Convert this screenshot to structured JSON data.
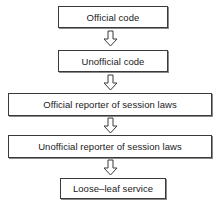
{
  "diagram": {
    "orientation": "vertical",
    "style": {
      "background": "#ffffff",
      "box_border": "#3a3a3a",
      "box_shadow": "#8a8a8a",
      "text_color": "#1a1a1a",
      "arrow_outline": "#3a3a3a",
      "arrow_fill": "#ffffff"
    },
    "nodes": [
      {
        "id": "official-code",
        "label": "Official code",
        "width": "narrow"
      },
      {
        "id": "unofficial-code",
        "label": "Unofficial code",
        "width": "narrow"
      },
      {
        "id": "official-reporter",
        "label": "Official reporter of session laws",
        "width": "wide"
      },
      {
        "id": "unofficial-reporter",
        "label": "Unofficial reporter of session laws",
        "width": "wide"
      },
      {
        "id": "looseleaf",
        "label": "Loose–leaf service",
        "width": "narrow"
      }
    ],
    "connectors": [
      {
        "id": "arrow-1",
        "icon": "down-block-arrow-icon",
        "from": "official-code",
        "to": "unofficial-code"
      },
      {
        "id": "arrow-2",
        "icon": "down-block-arrow-icon",
        "from": "unofficial-code",
        "to": "official-reporter"
      },
      {
        "id": "arrow-3",
        "icon": "down-block-arrow-icon",
        "from": "official-reporter",
        "to": "unofficial-reporter"
      },
      {
        "id": "arrow-4",
        "icon": "down-block-arrow-icon",
        "from": "unofficial-reporter",
        "to": "looseleaf"
      }
    ]
  }
}
